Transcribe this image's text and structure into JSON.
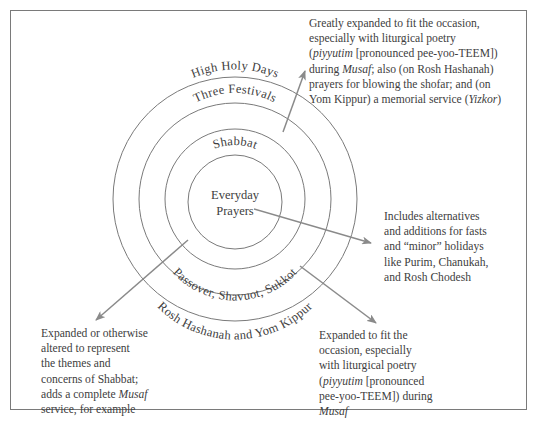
{
  "diagram": {
    "type": "concentric-circles",
    "rings": [
      {
        "id": "everyday",
        "label_lines": [
          "Everyday",
          "Prayers"
        ]
      },
      {
        "id": "shabbat",
        "label_top": "Shabbat"
      },
      {
        "id": "festivals",
        "label_top": "Three Festivals",
        "label_bottom": "Passover, Shavuot, Sukkot"
      },
      {
        "id": "high-holy-days",
        "label_top": "High Holy Days",
        "label_bottom": "Rosh Hashanah and Yom Kippur"
      }
    ],
    "colors": {
      "line": "#7a7a7a",
      "text": "#404040",
      "arrow": "#8a8a8a",
      "background": "#ffffff"
    }
  },
  "notes": {
    "high_holy_days": {
      "lines": [
        "Greatly expanded to fit the occasion,",
        "especially with liturgical poetry",
        "(<i>piyyutim</i> [pronounced pee-yoo-TEEM])",
        "during <i>Musaf</i>; also (on Rosh Hashanah)",
        "prayers for blowing the shofar; and (on",
        "Yom Kippur) a memorial service (<i>Yizkor</i>)"
      ]
    },
    "everyday": {
      "lines": [
        "Includes alternatives",
        "and additions for fasts",
        "and “minor” holidays",
        "like Purim, Chanukah,",
        "and Rosh Chodesh"
      ]
    },
    "shabbat": {
      "lines": [
        "Expanded or otherwise",
        "altered to represent",
        "the themes and",
        "concerns of Shabbat;",
        "adds a complete <i>Musaf</i>",
        "service, for example"
      ]
    },
    "festivals": {
      "lines": [
        "Expanded to fit the",
        "occasion, especially",
        "with liturgical poetry",
        "(<i>piyyutim</i> [pronounced",
        "pee-yoo-TEEM]) during",
        "<i>Musaf</i>"
      ]
    }
  }
}
